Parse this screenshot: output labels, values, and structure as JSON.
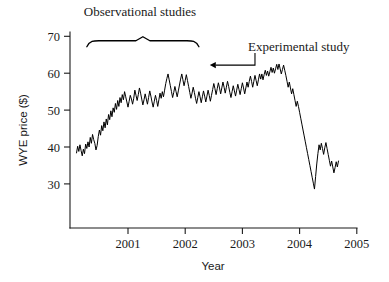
{
  "chart_data": {
    "type": "line",
    "title": "",
    "xlabel": "Year",
    "ylabel": "WYE price ($)",
    "xlim": [
      2000.05,
      2005.0
    ],
    "ylim": [
      24.0,
      70.0
    ],
    "grid": false,
    "legend": null,
    "y_ticks": [
      30,
      40,
      50,
      60,
      70
    ],
    "x_ticks": [
      2001,
      2002,
      2003,
      2004,
      2005
    ],
    "y_tick_labels": [
      "30",
      "40",
      "50",
      "60",
      "70"
    ],
    "x_tick_labels": [
      "2001",
      "2002",
      "2003",
      "2004",
      "2005"
    ],
    "annotations": [
      {
        "name": "observational-studies-label",
        "text": "Observational studies",
        "x": 2001.23,
        "y": 72.8,
        "kind": "brace-label"
      },
      {
        "name": "experimental-study-label",
        "text": "Experimental study",
        "x": 2003.25,
        "y": 65.0,
        "kind": "arrow-label"
      }
    ],
    "brace": {
      "x_start": 2000.28,
      "x_end": 2002.24,
      "y": 68.8,
      "label": "Observational studies"
    },
    "arrow": {
      "tip_x": 2002.43,
      "tip_y": 62.2,
      "elbow_x": 2003.22,
      "label": "Experimental study"
    },
    "series": [
      {
        "name": "WYE price",
        "color": "#000000",
        "x": [
          2000.1,
          2000.12,
          2000.14,
          2000.16,
          2000.18,
          2000.2,
          2000.22,
          2000.24,
          2000.26,
          2000.28,
          2000.3,
          2000.32,
          2000.34,
          2000.36,
          2000.38,
          2000.4,
          2000.42,
          2000.44,
          2000.46,
          2000.48,
          2000.5,
          2000.52,
          2000.54,
          2000.56,
          2000.58,
          2000.6,
          2000.62,
          2000.64,
          2000.66,
          2000.68,
          2000.7,
          2000.72,
          2000.74,
          2000.76,
          2000.78,
          2000.8,
          2000.82,
          2000.84,
          2000.86,
          2000.88,
          2000.9,
          2000.92,
          2000.94,
          2000.96,
          2000.98,
          2001.0,
          2001.02,
          2001.04,
          2001.06,
          2001.08,
          2001.1,
          2001.12,
          2001.14,
          2001.16,
          2001.18,
          2001.2,
          2001.22,
          2001.24,
          2001.26,
          2001.28,
          2001.3,
          2001.32,
          2001.34,
          2001.36,
          2001.38,
          2001.4,
          2001.42,
          2001.44,
          2001.46,
          2001.48,
          2001.5,
          2001.52,
          2001.54,
          2001.56,
          2001.58,
          2001.6,
          2001.62,
          2001.64,
          2001.66,
          2001.68,
          2001.7,
          2001.72,
          2001.74,
          2001.76,
          2001.78,
          2001.8,
          2001.82,
          2001.84,
          2001.86,
          2001.88,
          2001.9,
          2001.92,
          2001.94,
          2001.96,
          2001.98,
          2002.0,
          2002.02,
          2002.04,
          2002.06,
          2002.08,
          2002.1,
          2002.12,
          2002.14,
          2002.16,
          2002.18,
          2002.2,
          2002.22,
          2002.24,
          2002.26,
          2002.28,
          2002.3,
          2002.32,
          2002.34,
          2002.36,
          2002.38,
          2002.4,
          2002.42,
          2002.44,
          2002.46,
          2002.48,
          2002.5,
          2002.52,
          2002.54,
          2002.56,
          2002.58,
          2002.6,
          2002.62,
          2002.64,
          2002.66,
          2002.68,
          2002.7,
          2002.72,
          2002.74,
          2002.76,
          2002.78,
          2002.8,
          2002.82,
          2002.84,
          2002.86,
          2002.88,
          2002.9,
          2002.92,
          2002.94,
          2002.96,
          2002.98,
          2003.0,
          2003.02,
          2003.04,
          2003.06,
          2003.08,
          2003.1,
          2003.12,
          2003.14,
          2003.16,
          2003.18,
          2003.2,
          2003.22,
          2003.24,
          2003.26,
          2003.28,
          2003.3,
          2003.32,
          2003.34,
          2003.36,
          2003.38,
          2003.4,
          2003.42,
          2003.44,
          2003.46,
          2003.48,
          2003.5,
          2003.52,
          2003.54,
          2003.56,
          2003.58,
          2003.6,
          2003.62,
          2003.64,
          2003.66,
          2003.68,
          2003.7,
          2003.72,
          2003.74,
          2003.76,
          2003.78,
          2003.8,
          2003.82,
          2003.84,
          2003.86,
          2003.88,
          2003.9,
          2003.92,
          2003.94,
          2003.96,
          2003.98,
          2004.0,
          2004.02,
          2004.04,
          2004.06,
          2004.08,
          2004.1,
          2004.12,
          2004.14,
          2004.16,
          2004.18,
          2004.2,
          2004.22,
          2004.24,
          2004.26,
          2004.28,
          2004.3,
          2004.32,
          2004.34,
          2004.36,
          2004.38,
          2004.4,
          2004.42,
          2004.44,
          2004.46,
          2004.48,
          2004.5,
          2004.52,
          2004.54,
          2004.56,
          2004.58,
          2004.6,
          2004.62,
          2004.64,
          2004.66,
          2004.68
        ],
        "y": [
          38.4,
          40.2,
          38.8,
          40.6,
          39.0,
          37.6,
          39.4,
          38.2,
          40.8,
          39.6,
          41.4,
          40.0,
          42.6,
          41.0,
          43.4,
          42.0,
          41.0,
          39.2,
          40.4,
          42.8,
          44.6,
          43.2,
          45.8,
          44.4,
          46.8,
          45.2,
          47.6,
          46.0,
          48.8,
          47.4,
          49.8,
          48.2,
          50.6,
          49.4,
          51.8,
          50.2,
          52.6,
          51.0,
          53.4,
          52.0,
          54.2,
          52.8,
          55.0,
          53.6,
          52.2,
          50.8,
          52.4,
          54.0,
          53.0,
          51.6,
          53.2,
          55.4,
          54.0,
          52.6,
          54.2,
          56.0,
          54.6,
          53.0,
          51.4,
          52.8,
          54.4,
          53.0,
          51.6,
          53.4,
          55.2,
          53.8,
          52.2,
          50.8,
          52.4,
          54.0,
          52.6,
          51.0,
          52.8,
          54.6,
          53.2,
          55.0,
          53.6,
          55.4,
          57.2,
          58.6,
          59.8,
          58.2,
          56.6,
          55.0,
          53.4,
          54.8,
          56.4,
          55.0,
          53.6,
          55.2,
          56.8,
          58.4,
          59.8,
          58.2,
          56.6,
          58.0,
          59.6,
          58.0,
          56.4,
          54.8,
          53.2,
          54.6,
          56.2,
          54.8,
          53.2,
          51.8,
          53.4,
          55.0,
          53.6,
          52.0,
          53.6,
          55.2,
          53.8,
          52.2,
          53.8,
          55.4,
          54.0,
          52.4,
          54.0,
          55.6,
          57.2,
          55.8,
          54.2,
          55.8,
          57.4,
          56.0,
          54.4,
          56.0,
          57.6,
          56.2,
          54.6,
          56.2,
          57.8,
          56.4,
          54.8,
          53.4,
          55.0,
          56.6,
          55.2,
          53.8,
          55.4,
          57.0,
          55.6,
          54.2,
          55.8,
          57.4,
          56.0,
          54.4,
          56.0,
          57.6,
          56.2,
          57.8,
          59.2,
          57.8,
          56.2,
          57.8,
          59.4,
          58.0,
          56.6,
          58.2,
          59.8,
          58.4,
          59.8,
          58.2,
          59.6,
          60.8,
          59.4,
          60.6,
          59.2,
          60.4,
          61.6,
          60.2,
          61.4,
          60.0,
          61.2,
          62.4,
          61.0,
          62.5,
          61.2,
          59.8,
          61.0,
          62.2,
          60.8,
          59.4,
          57.8,
          56.2,
          57.6,
          56.0,
          54.4,
          55.8,
          54.2,
          52.6,
          51.0,
          52.4,
          51.0,
          49.4,
          47.8,
          46.2,
          44.6,
          43.0,
          41.4,
          39.8,
          38.2,
          36.6,
          35.0,
          33.4,
          31.8,
          30.2,
          28.6,
          32.0,
          35.4,
          38.2,
          40.6,
          39.2,
          41.0,
          39.6,
          38.0,
          39.8,
          41.2,
          39.6,
          38.0,
          36.4,
          34.8,
          36.2,
          34.6,
          33.0,
          34.4,
          36.0,
          34.6,
          36.2
        ]
      }
    ]
  }
}
